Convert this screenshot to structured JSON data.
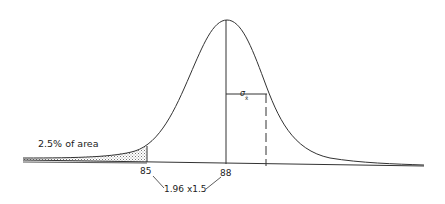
{
  "diagram": {
    "type": "normal-distribution",
    "annotations": {
      "tail_area": "2.5% of area",
      "lower_value": "85",
      "mean_value": "88",
      "sigma_symbol": "σ",
      "sigma_subscript": "x̄",
      "distance_label": "1.96 x1.5"
    },
    "colors": {
      "stroke": "#333333",
      "shade": "#999999",
      "background": "#ffffff"
    }
  }
}
